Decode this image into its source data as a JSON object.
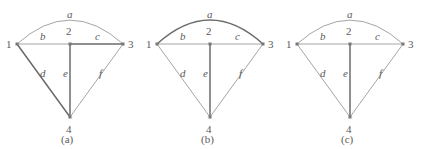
{
  "figure": {
    "panels": [
      {
        "caption": "(a)",
        "caption_pos": {
          "x": 61,
          "y": 134
        },
        "nodes": [
          {
            "id": "1",
            "label": "1",
            "x": 17,
            "y": 44,
            "label_pos": {
              "x": 6,
              "y": 39
            }
          },
          {
            "id": "2",
            "label": "2",
            "x": 70,
            "y": 44,
            "label_pos": {
              "x": 66,
              "y": 26
            }
          },
          {
            "id": "3",
            "label": "3",
            "x": 123,
            "y": 44,
            "label_pos": {
              "x": 128,
              "y": 39
            }
          },
          {
            "id": "4",
            "label": "4",
            "x": 70,
            "y": 117,
            "label_pos": {
              "x": 66,
              "y": 124
            }
          }
        ],
        "edges": [
          {
            "id": "a",
            "label": "a",
            "from": "1",
            "to": "3",
            "shape": "arc",
            "arc_peak_y": 20,
            "emphasis": "light",
            "label_pos": {
              "x": 67,
              "y": 9
            }
          },
          {
            "id": "b",
            "label": "b",
            "from": "1",
            "to": "2",
            "shape": "line",
            "emphasis": "light",
            "label_pos": {
              "x": 40,
              "y": 31
            }
          },
          {
            "id": "c",
            "label": "c",
            "from": "2",
            "to": "3",
            "shape": "line",
            "emphasis": "bold",
            "label_pos": {
              "x": 95,
              "y": 31
            }
          },
          {
            "id": "d",
            "label": "d",
            "from": "1",
            "to": "4",
            "shape": "line",
            "emphasis": "bold",
            "label_pos": {
              "x": 40,
              "y": 68
            }
          },
          {
            "id": "e",
            "label": "e",
            "from": "2",
            "to": "4",
            "shape": "line",
            "emphasis": "bold",
            "label_pos": {
              "x": 63,
              "y": 68
            }
          },
          {
            "id": "f",
            "label": "f",
            "from": "3",
            "to": "4",
            "shape": "line",
            "emphasis": "light",
            "label_pos": {
              "x": 99,
              "y": 68
            }
          }
        ]
      },
      {
        "caption": "(b)",
        "caption_pos": {
          "x": 61,
          "y": 134
        },
        "nodes": [
          {
            "id": "1",
            "label": "1",
            "x": 17,
            "y": 44,
            "label_pos": {
              "x": 6,
              "y": 39
            }
          },
          {
            "id": "2",
            "label": "2",
            "x": 70,
            "y": 44,
            "label_pos": {
              "x": 66,
              "y": 26
            }
          },
          {
            "id": "3",
            "label": "3",
            "x": 123,
            "y": 44,
            "label_pos": {
              "x": 128,
              "y": 39
            }
          },
          {
            "id": "4",
            "label": "4",
            "x": 70,
            "y": 117,
            "label_pos": {
              "x": 66,
              "y": 124
            }
          }
        ],
        "edges": [
          {
            "id": "a",
            "label": "a",
            "from": "1",
            "to": "3",
            "shape": "arc",
            "arc_peak_y": 20,
            "emphasis": "bold",
            "label_pos": {
              "x": 67,
              "y": 9
            }
          },
          {
            "id": "b",
            "label": "b",
            "from": "1",
            "to": "2",
            "shape": "line",
            "emphasis": "light",
            "label_pos": {
              "x": 40,
              "y": 31
            }
          },
          {
            "id": "c",
            "label": "c",
            "from": "2",
            "to": "3",
            "shape": "line",
            "emphasis": "light",
            "label_pos": {
              "x": 95,
              "y": 31
            }
          },
          {
            "id": "d",
            "label": "d",
            "from": "1",
            "to": "4",
            "shape": "line",
            "emphasis": "light",
            "label_pos": {
              "x": 40,
              "y": 68
            }
          },
          {
            "id": "e",
            "label": "e",
            "from": "2",
            "to": "4",
            "shape": "line",
            "emphasis": "bold",
            "label_pos": {
              "x": 63,
              "y": 68
            }
          },
          {
            "id": "f",
            "label": "f",
            "from": "3",
            "to": "4",
            "shape": "line",
            "emphasis": "light",
            "label_pos": {
              "x": 99,
              "y": 68
            }
          }
        ]
      },
      {
        "caption": "(c)",
        "caption_pos": {
          "x": 61,
          "y": 134
        },
        "nodes": [
          {
            "id": "1",
            "label": "1",
            "x": 17,
            "y": 44,
            "label_pos": {
              "x": 6,
              "y": 39
            }
          },
          {
            "id": "2",
            "label": "2",
            "x": 70,
            "y": 44,
            "label_pos": {
              "x": 66,
              "y": 26
            }
          },
          {
            "id": "3",
            "label": "3",
            "x": 123,
            "y": 44,
            "label_pos": {
              "x": 128,
              "y": 39
            }
          },
          {
            "id": "4",
            "label": "4",
            "x": 70,
            "y": 117,
            "label_pos": {
              "x": 66,
              "y": 124
            }
          }
        ],
        "edges": [
          {
            "id": "a",
            "label": "a",
            "from": "1",
            "to": "3",
            "shape": "arc",
            "arc_peak_y": 20,
            "emphasis": "light",
            "label_pos": {
              "x": 67,
              "y": 9
            }
          },
          {
            "id": "b",
            "label": "b",
            "from": "1",
            "to": "2",
            "shape": "line",
            "emphasis": "light",
            "label_pos": {
              "x": 40,
              "y": 31
            }
          },
          {
            "id": "c",
            "label": "c",
            "from": "2",
            "to": "3",
            "shape": "line",
            "emphasis": "light",
            "label_pos": {
              "x": 95,
              "y": 31
            }
          },
          {
            "id": "d",
            "label": "d",
            "from": "1",
            "to": "4",
            "shape": "line",
            "emphasis": "light",
            "label_pos": {
              "x": 40,
              "y": 68
            }
          },
          {
            "id": "e",
            "label": "e",
            "from": "2",
            "to": "4",
            "shape": "line",
            "emphasis": "bold",
            "label_pos": {
              "x": 63,
              "y": 68
            }
          },
          {
            "id": "f",
            "label": "f",
            "from": "3",
            "to": "4",
            "shape": "line",
            "emphasis": "light",
            "label_pos": {
              "x": 99,
              "y": 68
            }
          }
        ]
      }
    ],
    "style": {
      "edge_color_light": "#9a9a9a",
      "edge_color_bold": "#6b6b6b",
      "edge_width_light": 0.9,
      "edge_width_bold": 1.5,
      "node_color": "#777777",
      "node_size": 3,
      "text_color": "#5a5a5a",
      "background": "#ffffff"
    }
  }
}
